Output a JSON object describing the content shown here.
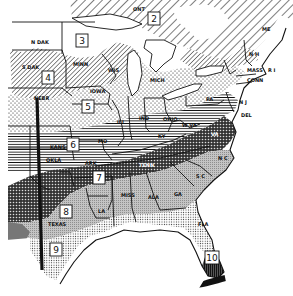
{
  "map": {
    "title": "Plant hardiness zones, eastern United States",
    "zones": [
      {
        "id": 2,
        "label": "2",
        "x": 154,
        "y": 19,
        "pattern": "diag-sparse"
      },
      {
        "id": 3,
        "label": "3",
        "x": 82,
        "y": 41,
        "pattern": "white"
      },
      {
        "id": 4,
        "label": "4",
        "x": 48,
        "y": 78,
        "pattern": "diag-dense"
      },
      {
        "id": 5,
        "label": "5",
        "x": 88,
        "y": 107,
        "pattern": "dots-sparse"
      },
      {
        "id": 6,
        "label": "6",
        "x": 73,
        "y": 145,
        "pattern": "horizontal-lines"
      },
      {
        "id": 7,
        "label": "7",
        "x": 99,
        "y": 178,
        "pattern": "crosshatch-dark"
      },
      {
        "id": 8,
        "label": "8",
        "x": 66,
        "y": 212,
        "pattern": "gray-stipple"
      },
      {
        "id": 9,
        "label": "9",
        "x": 56,
        "y": 250,
        "pattern": "dots-dense"
      },
      {
        "id": 10,
        "label": "10",
        "x": 212,
        "y": 258,
        "pattern": "vertical-dark"
      }
    ],
    "states": [
      {
        "label": "N DAK",
        "x": 31,
        "y": 44
      },
      {
        "label": "S DAK",
        "x": 22,
        "y": 69
      },
      {
        "label": "NEBR",
        "x": 34,
        "y": 100
      },
      {
        "label": "MINN",
        "x": 73,
        "y": 66
      },
      {
        "label": "WIS",
        "x": 108,
        "y": 72
      },
      {
        "label": "IOWA",
        "x": 90,
        "y": 93
      },
      {
        "label": "KANS",
        "x": 50,
        "y": 149
      },
      {
        "label": "MO",
        "x": 98,
        "y": 143
      },
      {
        "label": "ILL",
        "x": 117,
        "y": 124
      },
      {
        "label": "IND",
        "x": 139,
        "y": 120
      },
      {
        "label": "OHIO",
        "x": 163,
        "y": 121
      },
      {
        "label": "MICH",
        "x": 150,
        "y": 82
      },
      {
        "label": "KY",
        "x": 158,
        "y": 138
      },
      {
        "label": "W VA",
        "x": 182,
        "y": 127
      },
      {
        "label": "VA",
        "x": 211,
        "y": 136
      },
      {
        "label": "PA",
        "x": 206,
        "y": 101
      },
      {
        "label": "OKLA",
        "x": 46,
        "y": 162
      },
      {
        "label": "ARK",
        "x": 85,
        "y": 165
      },
      {
        "label": "TENN",
        "x": 139,
        "y": 167
      },
      {
        "label": "N C",
        "x": 218,
        "y": 160
      },
      {
        "label": "S C",
        "x": 196,
        "y": 178
      },
      {
        "label": "MISS",
        "x": 121,
        "y": 197
      },
      {
        "label": "ALA",
        "x": 148,
        "y": 199
      },
      {
        "label": "GA",
        "x": 174,
        "y": 196
      },
      {
        "label": "LA",
        "x": 98,
        "y": 213
      },
      {
        "label": "TEXAS",
        "x": 48,
        "y": 226
      },
      {
        "label": "FLA",
        "x": 198,
        "y": 226
      },
      {
        "label": "ONT",
        "x": 133,
        "y": 11
      },
      {
        "label": "ME",
        "x": 262,
        "y": 31
      },
      {
        "label": "N H",
        "x": 249,
        "y": 56
      },
      {
        "label": "MASS",
        "x": 247,
        "y": 72
      },
      {
        "label": "R I",
        "x": 268,
        "y": 72
      },
      {
        "label": "CONN",
        "x": 247,
        "y": 82
      },
      {
        "label": "N J",
        "x": 239,
        "y": 104
      },
      {
        "label": "DEL",
        "x": 241,
        "y": 117
      }
    ],
    "colors": {
      "ink": "#111111",
      "paper": "#ffffff",
      "gray_light": "#c8c8c8",
      "gray_mid": "#9a9a9a"
    }
  }
}
